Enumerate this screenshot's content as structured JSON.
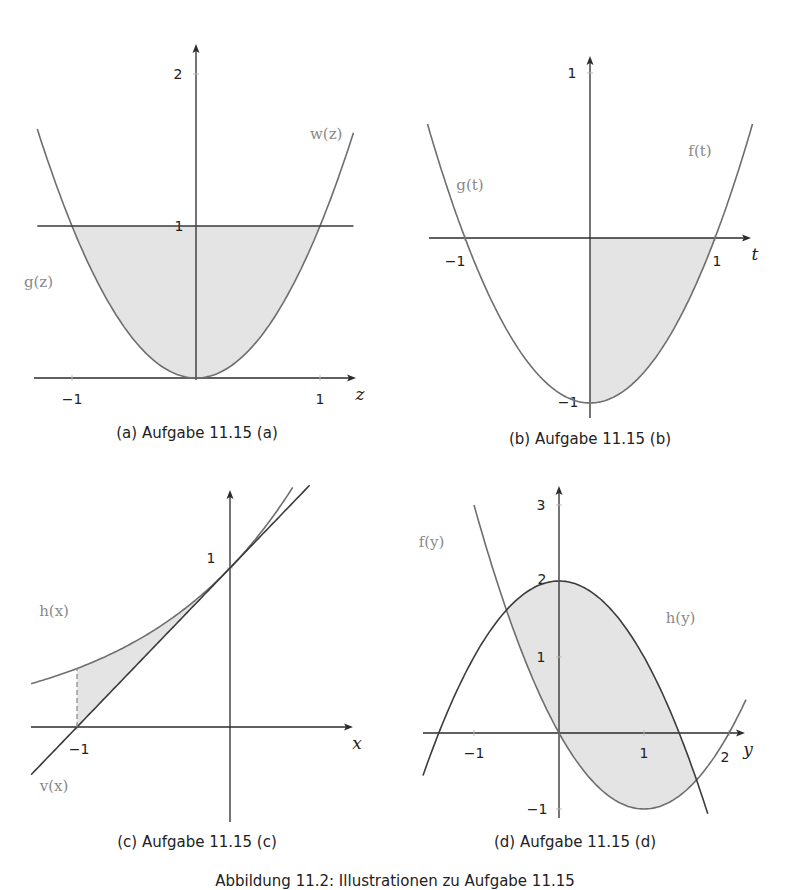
{
  "figure_caption": "Abbildung 11.2: Illustrationen zu Aufgabe 11.15",
  "colors": {
    "axis": "#2b2b2b",
    "curve": "#6e6e6e",
    "line": "#3a3a3a",
    "fill": "#e4e4e4",
    "label": "#8a8a8a",
    "tick_label": "#222222"
  },
  "chart_data": [
    {
      "id": "a",
      "type": "line",
      "title": "(a) Aufgabe 11.15 (a)",
      "xlabel": "z",
      "ylabel": "",
      "xlim": [
        -1.28,
        1.28
      ],
      "ylim": [
        0,
        2.2
      ],
      "xticks": [
        -1,
        1
      ],
      "yticks": [
        1,
        2
      ],
      "series": [
        {
          "name": "w(z)",
          "expr": "z^2",
          "domain": [
            -1.28,
            1.27
          ]
        },
        {
          "name": "g(z)",
          "expr": "1",
          "domain": [
            -1.28,
            1.27
          ]
        }
      ],
      "shaded_region": {
        "between": [
          "w(z)",
          "g(z)"
        ],
        "from": -1,
        "to": 1
      },
      "annotations": [
        {
          "text": "w(z)",
          "at": [
            1.05,
            1.57
          ]
        },
        {
          "text": "g(z)",
          "at": [
            -1.27,
            0.6
          ]
        }
      ]
    },
    {
      "id": "b",
      "type": "line",
      "title": "(b) Aufgabe 11.15 (b)",
      "xlabel": "t",
      "ylabel": "",
      "xlim": [
        -1.3,
        1.3
      ],
      "ylim": [
        -1.05,
        1.1
      ],
      "xticks": [
        -1,
        1
      ],
      "yticks": [
        -1,
        1
      ],
      "series": [
        {
          "name": "f(t)",
          "expr": "t^2 - 1",
          "domain": [
            0,
            1.3
          ]
        },
        {
          "name": "g(t)",
          "expr": "t^2 - 1",
          "domain": [
            -1.3,
            0
          ]
        }
      ],
      "shaded_region": {
        "between": [
          "f(t)",
          "t-axis"
        ],
        "from": 0,
        "to": 1
      },
      "annotations": [
        {
          "text": "f(t)",
          "at": [
            0.88,
            0.5
          ]
        },
        {
          "text": "g(t)",
          "at": [
            -0.96,
            0.29
          ]
        }
      ]
    },
    {
      "id": "c",
      "type": "line",
      "title": "(c) Aufgabe 11.15 (c)",
      "xlabel": "x",
      "ylabel": "",
      "xlim": [
        -1.3,
        0.8
      ],
      "ylim": [
        -0.6,
        1.5
      ],
      "xticks": [
        -1
      ],
      "yticks": [
        1
      ],
      "series": [
        {
          "name": "h(x)",
          "expr": "e^x",
          "domain": [
            -1.3,
            0.41
          ]
        },
        {
          "name": "v(x)",
          "expr": "x + 1",
          "domain": [
            -1.3,
            0.52
          ]
        }
      ],
      "shaded_region": {
        "between": [
          "h(x)",
          "v(x)"
        ],
        "from": -1,
        "to": 0
      },
      "dashed_line": {
        "x": -1,
        "from": 0,
        "to": 0.368
      },
      "annotations": [
        {
          "text": "h(x)",
          "at": [
            -1.15,
            0.7
          ]
        },
        {
          "text": "v(x)",
          "at": [
            -1.15,
            -0.4
          ]
        }
      ]
    },
    {
      "id": "d",
      "type": "line",
      "title": "(d) Aufgabe 11.15 (d)",
      "xlabel": "y",
      "ylabel": "",
      "xlim": [
        -1.6,
        2.2
      ],
      "ylim": [
        -1.1,
        3.2
      ],
      "xticks": [
        -1,
        1,
        2
      ],
      "yticks": [
        -1,
        1,
        2,
        3
      ],
      "series": [
        {
          "name": "f(y)",
          "expr": "y^2 - 2y",
          "domain": [
            -1.0,
            2.2
          ]
        },
        {
          "name": "h(y)",
          "expr": "2 - y^2",
          "domain": [
            -1.6,
            1.75
          ]
        }
      ],
      "shaded_region": {
        "between": [
          "h(y)",
          "f(y)"
        ],
        "from": -0.618,
        "to": 1.618
      },
      "annotations": [
        {
          "text": "f(y)",
          "at": [
            -1.5,
            2.45
          ]
        },
        {
          "text": "h(y)",
          "at": [
            1.43,
            1.45
          ]
        }
      ]
    }
  ]
}
